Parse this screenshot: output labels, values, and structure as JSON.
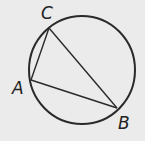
{
  "diagram": {
    "type": "inscribed-triangle",
    "background": "#ebebeb",
    "stroke_color": "#2a2a2a",
    "circle": {
      "cx": 82,
      "cy": 70,
      "rx": 53,
      "ry": 54
    },
    "vertices": [
      {
        "name": "C",
        "x": 49,
        "y": 28,
        "label_x": 41,
        "label_y": 19
      },
      {
        "name": "A",
        "x": 31,
        "y": 80,
        "label_x": 12,
        "label_y": 94
      },
      {
        "name": "B",
        "x": 117,
        "y": 108,
        "label_x": 118,
        "label_y": 129
      }
    ],
    "labels": {
      "C": "C",
      "A": "A",
      "B": "B"
    }
  }
}
